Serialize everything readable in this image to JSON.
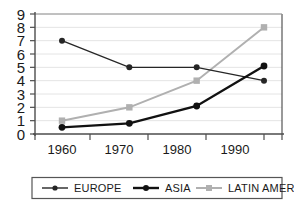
{
  "chart_data": {
    "type": "line",
    "title": "",
    "xlabel": "",
    "ylabel": "",
    "categories": [
      "1960",
      "1970",
      "1980",
      "1990"
    ],
    "x": [
      1960,
      1970,
      1980,
      1990
    ],
    "ylim": [
      0,
      9
    ],
    "yticks": [
      "0",
      "1",
      "2",
      "3",
      "4",
      "5",
      "6",
      "7",
      "8",
      "9"
    ],
    "grid": true,
    "legend_position": "bottom",
    "series": [
      {
        "name": "EUROPE",
        "values": [
          7,
          5,
          5,
          4
        ],
        "color": "#262626",
        "marker": "circle",
        "line_width": 1.4
      },
      {
        "name": "ASIA",
        "values": [
          0.5,
          0.8,
          2.1,
          5.1
        ],
        "color": "#111111",
        "marker": "circle",
        "line_width": 2.4
      },
      {
        "name": "LATIN AMERICA",
        "values": [
          1,
          2,
          4,
          8
        ],
        "color": "#b0b0b0",
        "marker": "square",
        "line_width": 2.0
      }
    ]
  },
  "legend": {
    "items": [
      {
        "label": "EUROPE"
      },
      {
        "label": "ASIA"
      },
      {
        "label": "LATIN AMERICA"
      }
    ]
  },
  "axes": {
    "y_tick_labels": [
      "9",
      "8",
      "7",
      "6",
      "5",
      "4",
      "3",
      "2",
      "1",
      "0"
    ],
    "x_tick_labels": [
      "1960",
      "1970",
      "1980",
      "1990"
    ]
  },
  "colors": {
    "axis": "#4d4d4d",
    "grid": "#e2e2e2",
    "frame": "#555555",
    "europe": "#262626",
    "asia": "#111111",
    "latin_america": "#b0b0b0",
    "text": "#1a1a1a"
  }
}
